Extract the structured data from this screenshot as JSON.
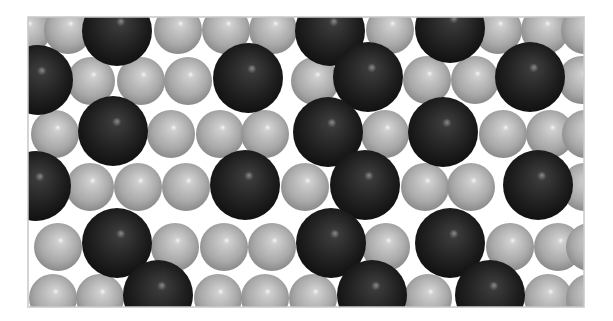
{
  "figure": {
    "background": "#ffffff",
    "frame": {
      "x": 28,
      "y": 17,
      "width": 556,
      "height": 290,
      "stroke": "#c8c8c8"
    },
    "species": {
      "light": {
        "label": "small light-gray atoms",
        "radius": 24,
        "base": "#a9a9a9",
        "mid": "#cfcfcf",
        "highlight": "#f4f4f4",
        "edge": "#8a8a8a"
      },
      "dark": {
        "label": "large dark-gray atoms",
        "radius": 35,
        "base": "#1e1e1e",
        "mid": "#3a3a3a",
        "highlight": "#8a8a8a",
        "edge": "#111111"
      }
    },
    "rows": [
      {
        "name": "row-1",
        "atoms": [
          {
            "t": "light",
            "x": 27,
            "y": 30
          },
          {
            "t": "light",
            "x": 68,
            "y": 30
          },
          {
            "t": "dark",
            "x": 117,
            "y": 31
          },
          {
            "t": "light",
            "x": 178,
            "y": 30
          },
          {
            "t": "light",
            "x": 226,
            "y": 30
          },
          {
            "t": "light",
            "x": 273,
            "y": 30
          },
          {
            "t": "dark",
            "x": 330,
            "y": 31
          },
          {
            "t": "light",
            "x": 390,
            "y": 30
          },
          {
            "t": "dark",
            "x": 450,
            "y": 28
          },
          {
            "t": "light",
            "x": 498,
            "y": 30
          },
          {
            "t": "light",
            "x": 545,
            "y": 30
          },
          {
            "t": "light",
            "x": 585,
            "y": 30
          }
        ]
      },
      {
        "name": "row-2",
        "atoms": [
          {
            "t": "dark",
            "x": 38,
            "y": 80
          },
          {
            "t": "light",
            "x": 91,
            "y": 81
          },
          {
            "t": "light",
            "x": 141,
            "y": 81
          },
          {
            "t": "light",
            "x": 188,
            "y": 81
          },
          {
            "t": "dark",
            "x": 248,
            "y": 78
          },
          {
            "t": "light",
            "x": 315,
            "y": 81
          },
          {
            "t": "dark",
            "x": 368,
            "y": 77
          },
          {
            "t": "light",
            "x": 427,
            "y": 80
          },
          {
            "t": "light",
            "x": 475,
            "y": 80
          },
          {
            "t": "dark",
            "x": 530,
            "y": 77
          },
          {
            "t": "light",
            "x": 582,
            "y": 80
          }
        ]
      },
      {
        "name": "row-3",
        "atoms": [
          {
            "t": "light",
            "x": 55,
            "y": 134
          },
          {
            "t": "dark",
            "x": 113,
            "y": 131
          },
          {
            "t": "light",
            "x": 171,
            "y": 134
          },
          {
            "t": "light",
            "x": 220,
            "y": 134
          },
          {
            "t": "light",
            "x": 265,
            "y": 134
          },
          {
            "t": "dark",
            "x": 328,
            "y": 132
          },
          {
            "t": "light",
            "x": 385,
            "y": 134
          },
          {
            "t": "dark",
            "x": 443,
            "y": 132
          },
          {
            "t": "light",
            "x": 503,
            "y": 134
          },
          {
            "t": "light",
            "x": 550,
            "y": 134
          },
          {
            "t": "light",
            "x": 586,
            "y": 134
          }
        ]
      },
      {
        "name": "row-4",
        "atoms": [
          {
            "t": "dark",
            "x": 36,
            "y": 186
          },
          {
            "t": "light",
            "x": 90,
            "y": 187
          },
          {
            "t": "light",
            "x": 138,
            "y": 187
          },
          {
            "t": "light",
            "x": 186,
            "y": 187
          },
          {
            "t": "dark",
            "x": 245,
            "y": 185
          },
          {
            "t": "light",
            "x": 305,
            "y": 187
          },
          {
            "t": "dark",
            "x": 365,
            "y": 185
          },
          {
            "t": "light",
            "x": 425,
            "y": 187
          },
          {
            "t": "light",
            "x": 471,
            "y": 187
          },
          {
            "t": "dark",
            "x": 538,
            "y": 185
          },
          {
            "t": "light",
            "x": 585,
            "y": 187
          }
        ]
      },
      {
        "name": "row-5",
        "atoms": [
          {
            "t": "light",
            "x": 58,
            "y": 247
          },
          {
            "t": "dark",
            "x": 117,
            "y": 243
          },
          {
            "t": "light",
            "x": 175,
            "y": 247
          },
          {
            "t": "light",
            "x": 224,
            "y": 247
          },
          {
            "t": "light",
            "x": 272,
            "y": 247
          },
          {
            "t": "dark",
            "x": 331,
            "y": 243
          },
          {
            "t": "light",
            "x": 386,
            "y": 247
          },
          {
            "t": "dark",
            "x": 450,
            "y": 243
          },
          {
            "t": "light",
            "x": 510,
            "y": 247
          },
          {
            "t": "light",
            "x": 558,
            "y": 247
          },
          {
            "t": "light",
            "x": 590,
            "y": 247
          }
        ]
      },
      {
        "name": "row-6",
        "atoms": [
          {
            "t": "light",
            "x": 53,
            "y": 298
          },
          {
            "t": "light",
            "x": 100,
            "y": 298
          },
          {
            "t": "dark",
            "x": 158,
            "y": 295
          },
          {
            "t": "light",
            "x": 218,
            "y": 298
          },
          {
            "t": "light",
            "x": 265,
            "y": 298
          },
          {
            "t": "light",
            "x": 313,
            "y": 298
          },
          {
            "t": "dark",
            "x": 372,
            "y": 295
          },
          {
            "t": "light",
            "x": 428,
            "y": 298
          },
          {
            "t": "dark",
            "x": 490,
            "y": 295
          },
          {
            "t": "light",
            "x": 548,
            "y": 298
          },
          {
            "t": "light",
            "x": 590,
            "y": 298
          }
        ]
      }
    ]
  }
}
